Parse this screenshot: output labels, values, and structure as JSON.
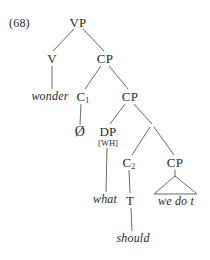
{
  "figure": {
    "example_number": "(68)",
    "clipped_header": "",
    "ink_color": "#6a6a6a",
    "text_color": "#2b2b2b",
    "background": "#ffffff"
  },
  "tree": {
    "nodes": [
      {
        "id": "vp",
        "label": "VP",
        "kind": "category",
        "x": 78,
        "y": 22
      },
      {
        "id": "v",
        "label": "V",
        "kind": "category",
        "x": 52,
        "y": 58
      },
      {
        "id": "cp1",
        "label": "CP",
        "kind": "category",
        "x": 105,
        "y": 58
      },
      {
        "id": "wonder",
        "label": "wonder",
        "kind": "terminal",
        "x": 50,
        "y": 96
      },
      {
        "id": "c1",
        "label": "C",
        "sub": "1",
        "kind": "category",
        "x": 83,
        "y": 96
      },
      {
        "id": "cp2",
        "label": "CP",
        "kind": "category",
        "x": 130,
        "y": 96
      },
      {
        "id": "null",
        "label": "Ø",
        "kind": "null",
        "x": 80,
        "y": 132
      },
      {
        "id": "dp",
        "label": "DP",
        "kind": "category",
        "x": 108,
        "y": 131
      },
      {
        "id": "dpfeat",
        "label": "[WH]",
        "kind": "feature",
        "x": 108,
        "y": 142
      },
      {
        "id": "c2",
        "label": "C",
        "sub": "2",
        "kind": "category",
        "x": 129,
        "y": 162
      },
      {
        "id": "cp3",
        "label": "CP",
        "kind": "category",
        "x": 175,
        "y": 162
      },
      {
        "id": "what",
        "label": "what",
        "kind": "terminal",
        "x": 105,
        "y": 199
      },
      {
        "id": "t",
        "label": "T",
        "kind": "category",
        "x": 130,
        "y": 200
      },
      {
        "id": "wedot",
        "label": "we do t",
        "kind": "terminal",
        "x": 176,
        "y": 201
      },
      {
        "id": "should",
        "label": "should",
        "kind": "terminal",
        "x": 133,
        "y": 238
      }
    ],
    "edges": [
      {
        "from": "vp",
        "to": "v",
        "x1": 74,
        "y1": 29,
        "x2": 53,
        "y2": 51
      },
      {
        "from": "vp",
        "to": "cp1",
        "x1": 83,
        "y1": 29,
        "x2": 104,
        "y2": 51
      },
      {
        "from": "v",
        "to": "wonder",
        "x1": 52,
        "y1": 66,
        "x2": 52,
        "y2": 89
      },
      {
        "from": "cp1",
        "to": "c1",
        "x1": 101,
        "y1": 66,
        "x2": 85,
        "y2": 89
      },
      {
        "from": "cp1",
        "to": "cp2",
        "x1": 109,
        "y1": 66,
        "x2": 128,
        "y2": 89
      },
      {
        "from": "c1",
        "to": "null",
        "x1": 81,
        "y1": 104,
        "x2": 80,
        "y2": 125
      },
      {
        "from": "cp2",
        "to": "dp",
        "x1": 125,
        "y1": 104,
        "x2": 110,
        "y2": 124
      },
      {
        "from": "cp2",
        "to": "cbar",
        "x1": 134,
        "y1": 104,
        "x2": 152,
        "y2": 124
      },
      {
        "from": "cbar",
        "to": "c2",
        "x1": 150,
        "y1": 127,
        "x2": 132,
        "y2": 155
      },
      {
        "from": "cbar",
        "to": "cp3",
        "x1": 154,
        "y1": 127,
        "x2": 174,
        "y2": 155
      },
      {
        "from": "dp",
        "to": "what",
        "x1": 107,
        "y1": 148,
        "x2": 106,
        "y2": 192
      },
      {
        "from": "c2",
        "to": "t",
        "x1": 129,
        "y1": 170,
        "x2": 130,
        "y2": 193
      },
      {
        "from": "t",
        "to": "should",
        "x1": 131,
        "y1": 208,
        "x2": 132,
        "y2": 231
      },
      {
        "from": "cp3",
        "to": "tri",
        "x1": 175,
        "y1": 170,
        "x2": 175,
        "y2": 176
      }
    ],
    "triangle": {
      "apex_x": 175,
      "apex_y": 176,
      "left_x": 154,
      "right_x": 197,
      "base_y": 194
    }
  }
}
